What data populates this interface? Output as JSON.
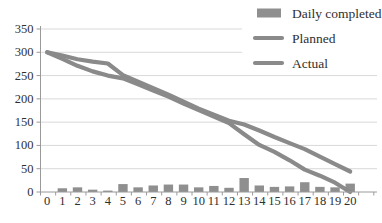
{
  "figure": {
    "kind": "sprint-burndown-chart",
    "background": "#ffffff"
  },
  "chart_data": {
    "type": "combo",
    "title": "",
    "xlabel": "",
    "ylabel": "",
    "categories": [
      0,
      1,
      2,
      3,
      4,
      5,
      6,
      7,
      8,
      9,
      10,
      11,
      12,
      13,
      14,
      15,
      16,
      17,
      18,
      19,
      20
    ],
    "series": [
      {
        "name": "Daily completed",
        "type": "bar",
        "color": "#8f8f8f",
        "values": [
          0,
          8,
          10,
          5,
          3,
          17,
          10,
          14,
          16,
          16,
          10,
          13,
          9,
          30,
          14,
          11,
          12,
          21,
          11,
          10,
          18
        ]
      },
      {
        "name": "Planned",
        "type": "line",
        "color": "#8a8a8a",
        "values": [
          300,
          286,
          271,
          259,
          250,
          244,
          231,
          218,
          205,
          190,
          176,
          162,
          148,
          124,
          101,
          86,
          68,
          48,
          35,
          20,
          0
        ]
      },
      {
        "name": "Actual",
        "type": "line",
        "color": "#8a8a8a",
        "values": [
          300,
          293,
          285,
          280,
          276,
          251,
          237,
          223,
          209,
          194,
          179,
          166,
          153,
          145,
          132,
          118,
          105,
          92,
          76,
          60,
          44
        ]
      }
    ],
    "ylim": [
      0,
      350
    ],
    "yticks": [
      0,
      50,
      100,
      150,
      200,
      250,
      300,
      350
    ],
    "grid": "horizontal",
    "legend_position": "top-right",
    "colors": {
      "grid": "#d9d9d9",
      "axis": "#9a9a9a",
      "text": "#2f2f2f",
      "background": "#ffffff"
    }
  }
}
